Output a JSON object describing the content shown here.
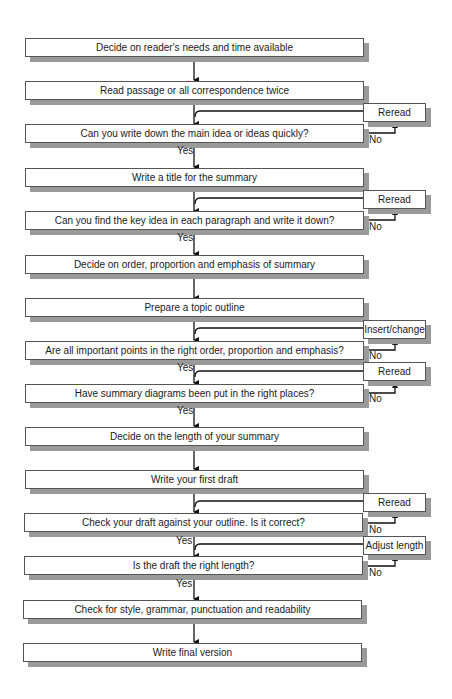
{
  "flowchart": {
    "steps": [
      {
        "id": "s1",
        "label": "Decide on reader's needs and time available"
      },
      {
        "id": "s2",
        "label": "Read passage or all correspondence twice"
      },
      {
        "id": "s3",
        "label": "Can you write down the main idea or ideas quickly?"
      },
      {
        "id": "s4",
        "label": "Write a title for the summary"
      },
      {
        "id": "s5",
        "label": "Can you find the key idea in each paragraph and write it down?"
      },
      {
        "id": "s6",
        "label": "Decide on order, proportion and emphasis of summary"
      },
      {
        "id": "s7",
        "label": "Prepare a topic outline"
      },
      {
        "id": "s8",
        "label": "Are all important points in the right order, proportion and emphasis?"
      },
      {
        "id": "s9",
        "label": "Have summary diagrams been put in the right places?"
      },
      {
        "id": "s10",
        "label": "Decide on the length of your summary"
      },
      {
        "id": "s11",
        "label": "Write your first draft"
      },
      {
        "id": "s12",
        "label": "Check your draft against your outline. Is it correct?"
      },
      {
        "id": "s13",
        "label": "Is the draft the right length?"
      },
      {
        "id": "s14",
        "label": "Check for style, grammar, punctuation and readability"
      },
      {
        "id": "s15",
        "label": "Write final version"
      }
    ],
    "loops": [
      {
        "from": "s3",
        "action": "Reread",
        "no_label": "No",
        "yes_label": "Yes"
      },
      {
        "from": "s5",
        "action": "Reread",
        "no_label": "No",
        "yes_label": "Yes"
      },
      {
        "from": "s8",
        "action": "Insert/change",
        "no_label": "No",
        "yes_label": "Yes"
      },
      {
        "from": "s9",
        "action": "Reread",
        "no_label": "No",
        "yes_label": "Yes"
      },
      {
        "from": "s12",
        "action": "Reread",
        "no_label": "No",
        "yes_label": "Yes"
      },
      {
        "from": "s13",
        "action": "Adjust length",
        "no_label": "No",
        "yes_label": "Yes"
      }
    ]
  }
}
